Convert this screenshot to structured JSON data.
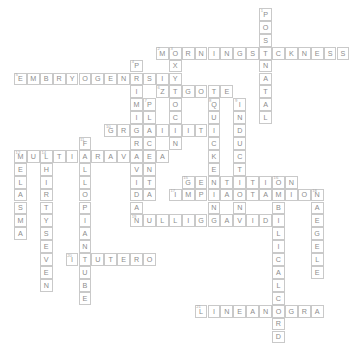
{
  "puzzle": {
    "title": "Pregnancy Terms Crossword",
    "grid": {
      "origin_x": 14,
      "origin_y": 8,
      "cell_size": 12.9,
      "cols": 24,
      "rows": 20
    },
    "style": {
      "cell_border_color": "#c9c9c9",
      "letter_color": "#8d8d8d",
      "number_color": "#a8a8a8",
      "background": "#ffffff"
    },
    "entries": [
      {
        "number": "1",
        "answer": "POSTNATAL",
        "direction": "down",
        "col": 19,
        "row": 0,
        "length": 9
      },
      {
        "number": "2",
        "answer": "MORNINGSICKNESS",
        "direction": "across",
        "col": 11,
        "row": 3,
        "length": 15
      },
      {
        "number": "3",
        "answer": "OXYTOCIN",
        "direction": "down",
        "col": 12,
        "row": 3,
        "length": 8
      },
      {
        "number": "4",
        "answer": "PRIMIGRAVIDA",
        "direction": "down",
        "col": 9,
        "row": 4,
        "length": 12
      },
      {
        "number": "5",
        "answer": "EMBRYOGENESIS",
        "direction": "across",
        "col": 0,
        "row": 5,
        "length": 13
      },
      {
        "number": "6",
        "answer": "ZYGOTE",
        "direction": "across",
        "col": 11,
        "row": 6,
        "length": 6
      },
      {
        "number": "7",
        "answer": "PLACENTA",
        "direction": "down",
        "col": 10,
        "row": 7,
        "length": 8
      },
      {
        "number": "8",
        "answer": "QUICKENING",
        "direction": "down",
        "col": 15,
        "row": 7,
        "length": 10
      },
      {
        "number": "9",
        "answer": "INDUCTION",
        "direction": "down",
        "col": 17,
        "row": 7,
        "length": 9
      },
      {
        "number": "10",
        "answer": "GRAVIDITY",
        "direction": "across",
        "col": 7,
        "row": 9,
        "length": 9
      },
      {
        "number": "11",
        "answer": "FALLOPIANTUBE",
        "direction": "down",
        "col": 5,
        "row": 10,
        "length": 13
      },
      {
        "number": "12",
        "answer": "MULTIGRAVIDA",
        "direction": "across",
        "col": 0,
        "row": 11,
        "length": 12
      },
      {
        "number": "13",
        "answer": "MELASMA",
        "direction": "down",
        "col": 0,
        "row": 11,
        "length": 7
      },
      {
        "number": "14",
        "answer": "THIRTYSEVEN",
        "direction": "down",
        "col": 2,
        "row": 11,
        "length": 11
      },
      {
        "number": "15",
        "answer": "GESTATION",
        "direction": "across",
        "col": 13,
        "row": 13,
        "length": 9
      },
      {
        "number": "16",
        "answer": "UMBILICALCORD",
        "direction": "down",
        "col": 20,
        "row": 13,
        "length": 13
      },
      {
        "number": "17",
        "answer": "IMPLANTATION",
        "direction": "across",
        "col": 12,
        "row": 14,
        "length": 12
      },
      {
        "number": "18",
        "answer": "NAEGELE",
        "direction": "down",
        "col": 23,
        "row": 14,
        "length": 7
      },
      {
        "number": "19",
        "answer": "NULLIGRAVIDA",
        "direction": "across",
        "col": 9,
        "row": 16,
        "length": 12
      },
      {
        "number": "20",
        "answer": "INUTERO",
        "direction": "across",
        "col": 4,
        "row": 19,
        "length": 7
      },
      {
        "number": "21",
        "answer": "LINEANIGRA",
        "direction": "across",
        "col": 14,
        "row": 23,
        "length": 10
      }
    ]
  }
}
